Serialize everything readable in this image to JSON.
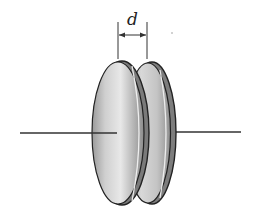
{
  "diagram": {
    "type": "parallel-plate-capacitor",
    "separation_label": "d",
    "colors": {
      "background": "#ffffff",
      "outline": "#222222",
      "plate_light": "#e6e6e6",
      "plate_mid": "#bdbdbd",
      "plate_dark": "#8a8a8a",
      "wire": "#333333"
    },
    "plates": [
      {
        "name": "left-plate"
      },
      {
        "name": "right-plate"
      }
    ],
    "wires": [
      {
        "name": "left-wire"
      },
      {
        "name": "right-wire"
      }
    ]
  }
}
